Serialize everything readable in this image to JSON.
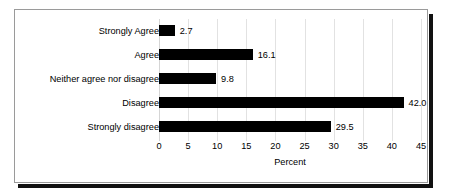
{
  "chart_data": {
    "type": "bar",
    "orientation": "horizontal",
    "title": "",
    "subtitle": "",
    "categories": [
      "Strongly Agree",
      "Agree",
      "Neither agree nor disagree",
      "Disagree",
      "Strongly disagree"
    ],
    "values": [
      2.7,
      16.1,
      9.8,
      42.0,
      29.5
    ],
    "value_labels": [
      "2.7",
      "16.1",
      "9.8",
      "42.0",
      "29.5"
    ],
    "xlabel": "Percent",
    "ylabel": "",
    "xlim": [
      0,
      45
    ],
    "xticks": [
      0,
      5,
      10,
      15,
      20,
      25,
      30,
      35,
      40,
      45
    ],
    "xtick_labels": [
      "0",
      "5",
      "10",
      "15",
      "20",
      "25",
      "30",
      "35",
      "40",
      "45"
    ],
    "grid": "vertical",
    "legend": "none",
    "bar_color": "#000000",
    "gridline_color": "#e2e2e2",
    "background_color": "#ffffff",
    "frame_border_color": "#9a9a9a",
    "shadow_color": "#111111"
  }
}
